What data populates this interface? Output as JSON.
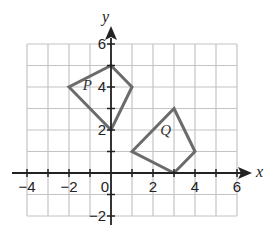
{
  "diagram": {
    "type": "coordinate-grid",
    "x_axis": {
      "label": "x",
      "min": -4,
      "max": 6,
      "tick_labels": [
        "−4",
        "−2",
        "0",
        "2",
        "4",
        "6"
      ],
      "tick_values": [
        -4,
        -2,
        0,
        2,
        4,
        6
      ]
    },
    "y_axis": {
      "label": "y",
      "min": -2,
      "max": 6,
      "tick_labels": [
        "6",
        "4",
        "2",
        "−2"
      ],
      "tick_values": [
        6,
        4,
        2,
        -2
      ]
    },
    "shapes": [
      {
        "name": "P",
        "vertices": [
          [
            0,
            5
          ],
          [
            1,
            4
          ],
          [
            0,
            2
          ],
          [
            -2,
            4
          ]
        ]
      },
      {
        "name": "Q",
        "vertices": [
          [
            3,
            3
          ],
          [
            4,
            1
          ],
          [
            3,
            0
          ],
          [
            1,
            1
          ]
        ]
      }
    ],
    "colors": {
      "grid": "#c4c4c4",
      "axis": "#222222",
      "shape": "#6b6b6b"
    }
  }
}
